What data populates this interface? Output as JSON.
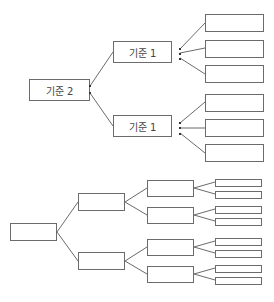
{
  "top_tree": {
    "root": {
      "label": "기준 2"
    },
    "branches": [
      {
        "label": "기준 1",
        "leaves": [
          "",
          "",
          ""
        ]
      },
      {
        "label": "기준 1",
        "leaves": [
          "",
          "",
          ""
        ]
      }
    ]
  },
  "bottom_tree": {
    "root": {
      "label": ""
    },
    "level1": [
      {
        "label": "",
        "children": [
          {
            "label": "",
            "leaves": [
              "",
              ""
            ]
          },
          {
            "label": "",
            "leaves": [
              "",
              ""
            ]
          }
        ]
      },
      {
        "label": "",
        "children": [
          {
            "label": "",
            "leaves": [
              "",
              ""
            ]
          },
          {
            "label": "",
            "leaves": [
              "",
              ""
            ]
          }
        ]
      }
    ]
  },
  "colors": {
    "line": "#6b6b6b",
    "text": "#444444",
    "background": "#ffffff"
  }
}
